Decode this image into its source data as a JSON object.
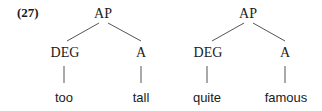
{
  "example_number": "(27)",
  "trees": [
    {
      "root": "AP",
      "left": {
        "category": "DEG",
        "word": "too"
      },
      "right": {
        "category": "A",
        "word": "tall"
      }
    },
    {
      "root": "AP",
      "left": {
        "category": "DEG",
        "word": "quite"
      },
      "right": {
        "category": "A",
        "word": "famous"
      }
    }
  ],
  "colors": {
    "text": "#1a1a1a",
    "lines": "#555555",
    "background": "#ffffff"
  }
}
